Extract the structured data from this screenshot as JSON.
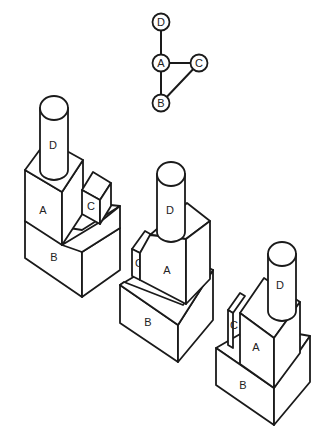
{
  "graph": {
    "nodes": [
      {
        "id": "D",
        "label": "D",
        "x": 161,
        "y": 22
      },
      {
        "id": "A",
        "label": "A",
        "x": 161,
        "y": 63
      },
      {
        "id": "C",
        "label": "C",
        "x": 199,
        "y": 63
      },
      {
        "id": "B",
        "label": "B",
        "x": 161,
        "y": 103
      }
    ],
    "edges": [
      [
        "D",
        "A"
      ],
      [
        "A",
        "C"
      ],
      [
        "A",
        "B"
      ],
      [
        "C",
        "B"
      ]
    ]
  },
  "structures": [
    {
      "name": "structure-1",
      "labels": {
        "A": "A",
        "B": "B",
        "C": "C",
        "D": "D"
      }
    },
    {
      "name": "structure-2",
      "labels": {
        "A": "A",
        "B": "B",
        "C": "C",
        "D": "D"
      }
    },
    {
      "name": "structure-3",
      "labels": {
        "A": "A",
        "B": "B",
        "C": "C",
        "D": "D"
      }
    }
  ]
}
